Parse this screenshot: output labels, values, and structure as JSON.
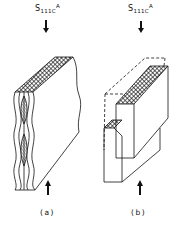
{
  "figure": {
    "panels": [
      {
        "id": "a",
        "stress_label": {
          "symbol": "S",
          "subscript": "111C",
          "superscript": "A"
        },
        "caption": "(a)",
        "description": "Slab with wavy (kinked) front strips, hatched top face, compressive arrows top and bottom"
      },
      {
        "id": "b",
        "stress_label": {
          "symbol": "S",
          "subscript": "111C",
          "superscript": "A"
        },
        "caption": "(b)",
        "description": "Slab with displaced block (dashed original outline), hatched top and step faces, compressive arrows top and bottom"
      }
    ],
    "colors": {
      "ink": "#111111",
      "background": "#ffffff"
    }
  }
}
